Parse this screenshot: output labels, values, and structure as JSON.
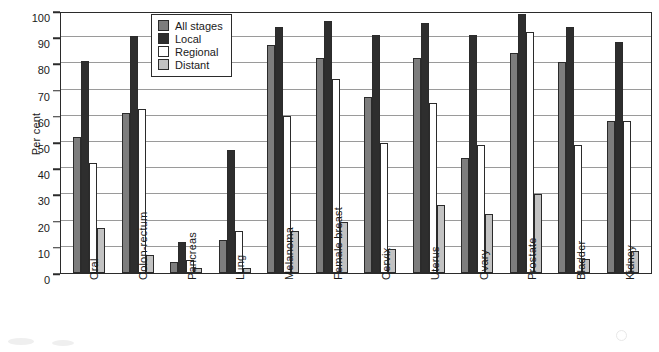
{
  "chart_data": {
    "type": "bar",
    "title": "",
    "xlabel": "",
    "ylabel": "Per cent",
    "ylim": [
      0,
      100
    ],
    "ytick_step": 10,
    "yticks": [
      0,
      10,
      20,
      30,
      40,
      50,
      60,
      70,
      80,
      90,
      100
    ],
    "grid": true,
    "legend_position": "top-center-inside",
    "categories": [
      "Oral",
      "Colon-rectum",
      "Pancreas",
      "Lung",
      "Melanoma",
      "Female breast",
      "Cervix",
      "Uterus",
      "Ovary",
      "Prostate",
      "Bladder",
      "Kidney"
    ],
    "series": [
      {
        "name": "All stages",
        "color": "#7d7d7d",
        "values": [
          52,
          61,
          4.2,
          12.5,
          87,
          82,
          67,
          82,
          44,
          84,
          80.5,
          58
        ]
      },
      {
        "name": "Local",
        "color": "#2e2e2e",
        "values": [
          81,
          90.5,
          12,
          47,
          94,
          96,
          91,
          95.5,
          91,
          99,
          94,
          88
        ]
      },
      {
        "name": "Regional",
        "color": "#ffffff",
        "values": [
          42,
          62.5,
          5,
          16,
          60,
          74,
          49.5,
          65,
          49,
          92,
          49,
          58
        ]
      },
      {
        "name": "Distant",
        "color": "#c2c2c2",
        "values": [
          17,
          7,
          2,
          2,
          16,
          19.5,
          9,
          26,
          22.5,
          30,
          5.5,
          8.5
        ]
      }
    ]
  },
  "legend": {
    "items": [
      {
        "label": "All stages",
        "color": "#7d7d7d"
      },
      {
        "label": "Local",
        "color": "#2e2e2e"
      },
      {
        "label": "Regional",
        "color": "#ffffff"
      },
      {
        "label": "Distant",
        "color": "#c2c2c2"
      }
    ]
  }
}
